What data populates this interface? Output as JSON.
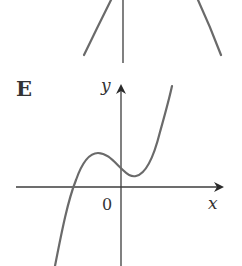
{
  "figure": {
    "panel_label": "E",
    "axis_labels": {
      "x": "x",
      "y": "y"
    },
    "origin_label": "0",
    "colors": {
      "axis": "#3d3d3d",
      "curve": "#6a6a6a",
      "text": "#333333"
    }
  },
  "previous_panel": {
    "type": "parabola-fragment"
  }
}
